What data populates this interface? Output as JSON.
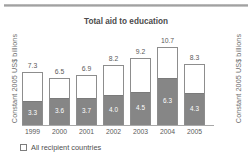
{
  "chart_data": {
    "type": "bar",
    "title": "Total aid to education",
    "xlabel": "",
    "ylabel": "Constant 2005 US$ billions",
    "ylabel_right": "Constant 2005 US$ billions",
    "categories": [
      "1999",
      "2000",
      "2001",
      "2002",
      "2003",
      "2004",
      "2005"
    ],
    "series": [
      {
        "name": "Basic education (lower segment)",
        "values": [
          3.3,
          3.6,
          3.7,
          4.0,
          4.5,
          6.3,
          4.3
        ],
        "color": "#868686"
      },
      {
        "name": "All recipient countries (total)",
        "values": [
          7.3,
          6.5,
          6.9,
          8.2,
          9.2,
          10.7,
          8.3
        ],
        "color": "#ffffff"
      }
    ],
    "total_labels": [
      "7.3",
      "6.5",
      "6.9",
      "8.2",
      "9.2",
      "10.7",
      "8.3"
    ],
    "segment_labels": [
      "3.3",
      "3.6",
      "3.7",
      "4.0",
      "4.5",
      "6.3",
      "4.3"
    ],
    "ylim": [
      0,
      11.6
    ],
    "grid": false,
    "legend_position": "bottom-left",
    "stacked": true
  },
  "legend": {
    "items": [
      {
        "label": "All recipient countries",
        "marker": "empty-square"
      }
    ]
  },
  "colors": {
    "bar_fill_lower": "#868686",
    "bar_fill_upper": "#ffffff",
    "bar_border": "#8d8d8d",
    "text": "#4f4f4f",
    "rule": "#9c9c9c"
  }
}
